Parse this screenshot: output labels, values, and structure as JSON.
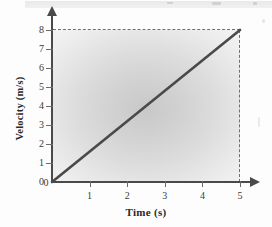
{
  "chart_data": {
    "type": "line",
    "title": "",
    "xlabel": "Time (s)",
    "ylabel": "Velocity (m/s)",
    "xlim": [
      0,
      5
    ],
    "ylim": [
      0,
      8
    ],
    "xticks": [
      "0",
      "1",
      "2",
      "3",
      "4",
      "5"
    ],
    "yticks": [
      "0",
      "1",
      "2",
      "3",
      "4",
      "5",
      "6",
      "7",
      "8"
    ],
    "grid": false,
    "legend": null,
    "series": [
      {
        "name": "velocity",
        "x": [
          0,
          5
        ],
        "values": [
          0,
          8
        ]
      }
    ],
    "annotations": [
      {
        "name": "dashed-horizontal-guide",
        "value": 8,
        "axis": "y",
        "style": "dashed"
      },
      {
        "name": "dashed-vertical-guide",
        "value": 5,
        "axis": "x",
        "style": "dashed"
      }
    ],
    "colors": {
      "line": "#4a4a4a",
      "axis": "#4a4a4a",
      "plot_background": "#d8d8d8",
      "guide": "#6f6f6f"
    }
  }
}
